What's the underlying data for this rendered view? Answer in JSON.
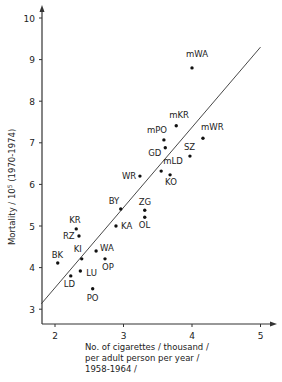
{
  "chart_data": {
    "type": "scatter",
    "title": "",
    "xlabel_lines": [
      "No. of cigarettes / thousand /",
      "per adult person per year /",
      "1958-1964 /"
    ],
    "ylabel": "Mortality / 10^5 (1970-1974)",
    "ylabel_main": "Mortality / 10",
    "ylabel_sup": "5",
    "ylabel_tail": " (1970-1974)",
    "xlim": [
      1.8,
      5.3
    ],
    "ylim": [
      2.9,
      10.3
    ],
    "xticks": [
      2,
      3,
      4,
      5
    ],
    "yticks": [
      3,
      4,
      5,
      6,
      7,
      8,
      9,
      10
    ],
    "grid": false,
    "points": [
      {
        "label": "mWA",
        "x": 4.0,
        "y": 8.8
      },
      {
        "label": "mKR",
        "x": 3.77,
        "y": 7.41
      },
      {
        "label": "mPO",
        "x": 3.59,
        "y": 7.07
      },
      {
        "label": "GD",
        "x": 3.61,
        "y": 6.88
      },
      {
        "label": "mWR",
        "x": 4.16,
        "y": 7.11
      },
      {
        "label": "SZ",
        "x": 3.97,
        "y": 6.68
      },
      {
        "label": "mLD",
        "x": 3.55,
        "y": 6.32
      },
      {
        "label": "KO",
        "x": 3.68,
        "y": 6.23
      },
      {
        "label": "WR",
        "x": 3.24,
        "y": 6.2
      },
      {
        "label": "BY",
        "x": 2.96,
        "y": 5.41
      },
      {
        "label": "KA",
        "x": 2.89,
        "y": 5.0
      },
      {
        "label": "ZG",
        "x": 3.31,
        "y": 5.38
      },
      {
        "label": "OL",
        "x": 3.31,
        "y": 5.21
      },
      {
        "label": "KR",
        "x": 2.31,
        "y": 4.93
      },
      {
        "label": "RZ",
        "x": 2.35,
        "y": 4.76
      },
      {
        "label": "BK",
        "x": 2.04,
        "y": 4.11
      },
      {
        "label": "KI",
        "x": 2.39,
        "y": 4.21
      },
      {
        "label": "WA",
        "x": 2.6,
        "y": 4.4
      },
      {
        "label": "OP",
        "x": 2.73,
        "y": 4.21
      },
      {
        "label": "LU",
        "x": 2.37,
        "y": 3.92
      },
      {
        "label": "LD",
        "x": 2.23,
        "y": 3.8
      },
      {
        "label": "PO",
        "x": 2.55,
        "y": 3.49
      }
    ],
    "label_offsets": {
      "mWA": [
        -6,
        -11
      ],
      "mKR": [
        -7,
        -8
      ],
      "mPO": [
        -17,
        -7
      ],
      "GD": [
        -17,
        8
      ],
      "mWR": [
        -2,
        -8
      ],
      "SZ": [
        -6,
        -6
      ],
      "mLD": [
        2,
        -7
      ],
      "KO": [
        -5,
        10
      ],
      "WR": [
        -18,
        3
      ],
      "BY": [
        -12,
        -5
      ],
      "KA": [
        5,
        3
      ],
      "ZG": [
        -6,
        -5
      ],
      "OL": [
        -6,
        11
      ],
      "KR": [
        -7,
        -6
      ],
      "RZ": [
        -16,
        3
      ],
      "BK": [
        -6,
        -5
      ],
      "KI": [
        -8,
        -7
      ],
      "WA": [
        4,
        0
      ],
      "OP": [
        -3,
        11
      ],
      "LU": [
        6,
        5
      ],
      "LD": [
        -7,
        11
      ],
      "PO": [
        -6,
        12
      ]
    },
    "regression_line": {
      "x": [
        1.8,
        5.0
      ],
      "y": [
        3.13,
        9.3
      ]
    }
  }
}
